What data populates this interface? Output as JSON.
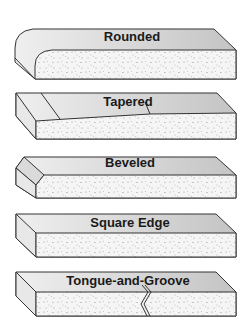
{
  "diagram": {
    "colors": {
      "top_face": "#d0d0d0",
      "top_face_light": "#ebebeb",
      "side_face": "#e6e6e6",
      "front_face": "#f4f4f4",
      "speckle": "#9a9a9a",
      "outline": "#333333",
      "label": "#1a1a1a"
    },
    "profiles": [
      {
        "id": "rounded",
        "label": "Rounded"
      },
      {
        "id": "tapered",
        "label": "Tapered"
      },
      {
        "id": "beveled",
        "label": "Beveled"
      },
      {
        "id": "square-edge",
        "label": "Square Edge"
      },
      {
        "id": "tongue-and-groove",
        "label": "Tongue-and-Groove"
      }
    ]
  }
}
